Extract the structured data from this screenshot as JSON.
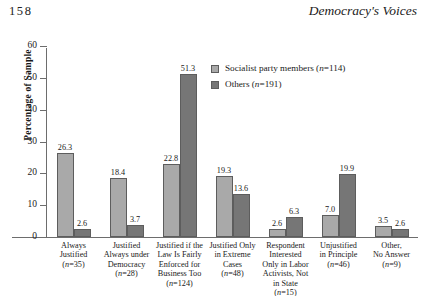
{
  "page": {
    "folio": "158",
    "running_title": "Democracy's Voices"
  },
  "legend": {
    "position": "inside-top-center",
    "entries": [
      {
        "label": "Socialist party members (n=114)",
        "color": "#a9a9a9"
      },
      {
        "label": "Others (n=191)",
        "color": "#767676"
      }
    ]
  },
  "chart_data": {
    "type": "bar",
    "title": "",
    "xlabel": "",
    "ylabel": "Percentage of Sample",
    "ylim": [
      0,
      60
    ],
    "yticks": [
      0,
      10,
      20,
      30,
      40,
      50,
      60
    ],
    "grid": false,
    "legend_position": "inside-top-center",
    "categories": [
      "Always Justified (n=35)",
      "Justified Always under Democracy (n=28)",
      "Justified if the Law Is Fairly Enforced for Business Too (n=124)",
      "Justified Only in Extreme Cases (n=48)",
      "Respondent Interested Only in Labor Activists, Not in State (n=15)",
      "Unjustified in Principle (n=46)",
      "Other, No Answer (n=9)"
    ],
    "category_lines": [
      [
        "Always",
        "Justified",
        "(n=35)"
      ],
      [
        "Justified",
        "Always under",
        "Democracy",
        "(n=28)"
      ],
      [
        "Justified if the",
        "Law Is Fairly",
        "Enforced for",
        "Business Too",
        "(n=124)"
      ],
      [
        "Justified Only",
        "in Extreme",
        "Cases",
        "(n=48)"
      ],
      [
        "Respondent",
        "Interested",
        "Only in Labor",
        "Activists, Not",
        "in State",
        "(n=15)"
      ],
      [
        "Unjustified",
        "in Principle",
        "(n=46)"
      ],
      [
        "Other,",
        "No Answer",
        "(n=9)"
      ]
    ],
    "series": [
      {
        "name": "Socialist party members (n=114)",
        "color": "#a9a9a9",
        "values": [
          26.3,
          18.4,
          22.8,
          19.3,
          2.6,
          7.0,
          3.5
        ]
      },
      {
        "name": "Others (n=191)",
        "color": "#767676",
        "values": [
          2.6,
          3.7,
          51.3,
          13.6,
          6.3,
          19.9,
          2.6
        ]
      }
    ],
    "value_labels": [
      [
        "26.3",
        "18.4",
        "22.8",
        "19.3",
        "2.6",
        "7.0",
        "3.5"
      ],
      [
        "2.6",
        "3.7",
        "51.3",
        "13.6",
        "6.3",
        "19.9",
        "2.6"
      ]
    ]
  }
}
